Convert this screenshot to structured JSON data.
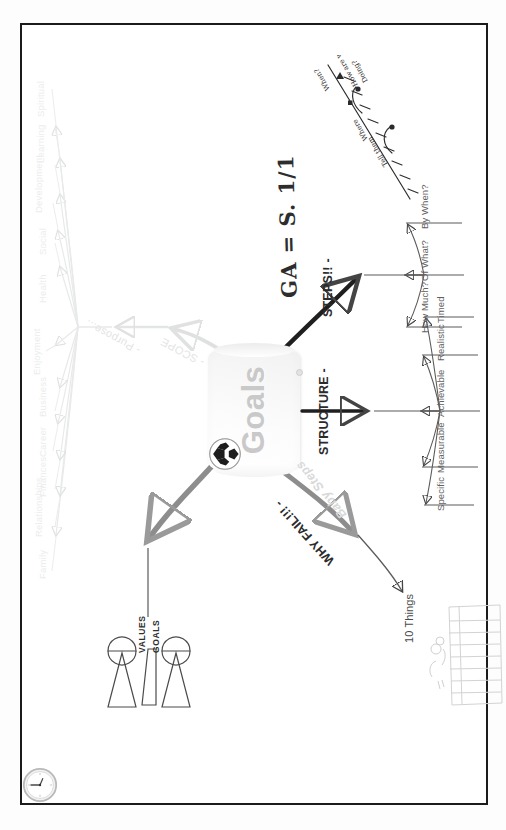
{
  "page": {
    "orientation": "rotated-90",
    "frame_color": "#1b1b1b",
    "background": "#ffffff"
  },
  "center": {
    "label": "Goals",
    "icon": "soccer-ball-icon",
    "text_color": "#c9c9c9"
  },
  "handwriting": {
    "formula": "GA = S. 1/1",
    "bottom_right_note_1": "When?",
    "bottom_right_note_2": "How are we",
    "bottom_right_note_3": "Doing?",
    "bottom_right_note_4": "Where",
    "bottom_right_note_5": "Tell them",
    "top_left_note": "Goals &",
    "top_left_note_2": "Lane"
  },
  "branches": [
    {
      "id": "why-fail",
      "label": "WHY FAIL!!! -",
      "style": "bold-dark",
      "children": [
        {
          "label": "10 Things"
        }
      ]
    },
    {
      "id": "baby-steps",
      "label": "Baby Steps",
      "style": "soft-italic",
      "children": []
    },
    {
      "id": "structure",
      "label": "STRUCTURE -",
      "style": "bold-dark",
      "children": [
        {
          "label": "Specific"
        },
        {
          "label": "Measurable"
        },
        {
          "label": "Achievable"
        },
        {
          "label": "Realistic"
        },
        {
          "label": "Timed"
        }
      ]
    },
    {
      "id": "steps",
      "label": "STEPS!! -",
      "style": "bold-dark",
      "children": [
        {
          "label": "How Much?"
        },
        {
          "label": "Of What?"
        },
        {
          "label": "By When?"
        }
      ]
    },
    {
      "id": "values-goals",
      "label_top": "VALUES",
      "label_bottom": "GOALS",
      "style": "caps-dark",
      "icon": "bowtie-funnel-diagram",
      "children": []
    },
    {
      "id": "scope",
      "label": "- SCOPE",
      "style": "ghost",
      "children": []
    },
    {
      "id": "purpose",
      "label": "- Purpose...",
      "style": "ghost",
      "children": []
    }
  ],
  "life_areas": {
    "style": "ghost",
    "items": [
      "Family",
      "Relationships",
      "Finances",
      "Career",
      "Business",
      "Enjoyment",
      "Health",
      "Social",
      "Development",
      "Learning",
      "Spiritual"
    ]
  },
  "icons": {
    "clock": "analog-clock-icon",
    "soccer_ball": "soccer-ball-icon",
    "bowtie": "bowtie-funnel-icon",
    "grid_sketch": "hand-drawn-grid-sketch",
    "timeline_sketch": "hand-drawn-timeline-sketch"
  },
  "colors": {
    "ink_dark": "#2b2b2b",
    "ink_mid": "#616161",
    "ink_ghost": "#e3e4e5",
    "connector_grey": "#8d8d8d",
    "connector_black": "#1f1f1f",
    "node_text": "#c9c9c9"
  }
}
